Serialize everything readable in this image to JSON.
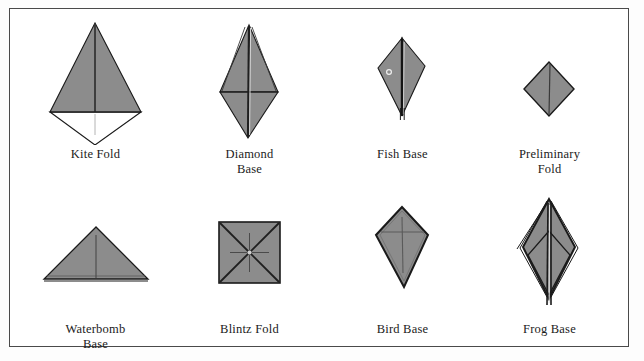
{
  "figure": {
    "border_color": "#4a4a4a",
    "background_color": "#ffffff",
    "paper_fill": "#8c8c8c",
    "fold_line_color": "#3a3a3a",
    "outline_color": "#1a1a1a",
    "caption_color": "#1b1b1b",
    "rows": 2,
    "columns": 4
  },
  "items": [
    {
      "id": "kite-fold",
      "label": "Kite Fold",
      "row": 1,
      "column": 1,
      "shape": "kite with lower white flap",
      "filled": "upper triangle gray, lower triangle white"
    },
    {
      "id": "diamond-base",
      "label": "Diamond\nBase",
      "row": 1,
      "column": 2,
      "shape": "tall rhombus with horizontal crease",
      "filled": "gray"
    },
    {
      "id": "fish-base",
      "label": "Fish Base",
      "row": 1,
      "column": 3,
      "shape": "narrow dart with central flap",
      "filled": "gray"
    },
    {
      "id": "preliminary-fold",
      "label": "Preliminary\nFold",
      "row": 1,
      "column": 4,
      "shape": "square rotated forty five degrees",
      "filled": "gray"
    },
    {
      "id": "waterbomb-base",
      "label": "Waterbomb\nBase",
      "row": 2,
      "column": 1,
      "shape": "wide isosceles triangle",
      "filled": "gray"
    },
    {
      "id": "blintz-fold",
      "label": "Blintz Fold",
      "row": 2,
      "column": 2,
      "shape": "square with diagonals and center cross",
      "filled": "gray"
    },
    {
      "id": "bird-base",
      "label": "Bird Base",
      "row": 2,
      "column": 3,
      "shape": "kite with crease cross",
      "filled": "gray"
    },
    {
      "id": "frog-base",
      "label": "Frog Base",
      "row": 2,
      "column": 4,
      "shape": "layered tall rhombus with inner chevron",
      "filled": "gray"
    }
  ]
}
